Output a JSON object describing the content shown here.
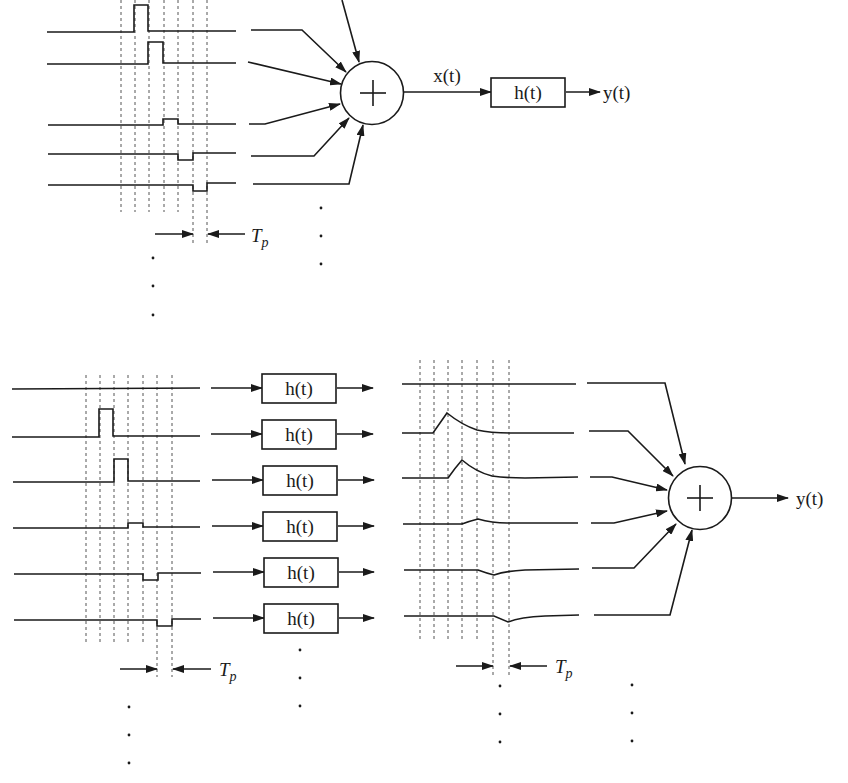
{
  "colors": {
    "stroke": "#1a1a1a",
    "dash": "#555555",
    "background": "#ffffff"
  },
  "top": {
    "sum_symbol": "+",
    "signal_label": "x(t)",
    "filter_label": "h(t)",
    "output_label": "y(t)",
    "pulse_width_label": "T",
    "pulse_width_subscript": "p",
    "num_channels_shown": 5,
    "pulse_amplitudes": [
      1.0,
      0.85,
      0.25,
      -0.3,
      -0.35
    ]
  },
  "bottom": {
    "sum_symbol": "+",
    "filter_labels": [
      "h(t)",
      "h(t)",
      "h(t)",
      "h(t)",
      "h(t)",
      "h(t)"
    ],
    "output_label": "y(t)",
    "pulse_width_label_left": "T",
    "pulse_width_subscript_left": "p",
    "pulse_width_label_right": "T",
    "pulse_width_subscript_right": "p",
    "num_channels_shown": 6,
    "pulse_amplitudes": [
      0,
      1.0,
      0.85,
      0.25,
      -0.3,
      -0.35
    ]
  },
  "ellipsis": "⋮"
}
